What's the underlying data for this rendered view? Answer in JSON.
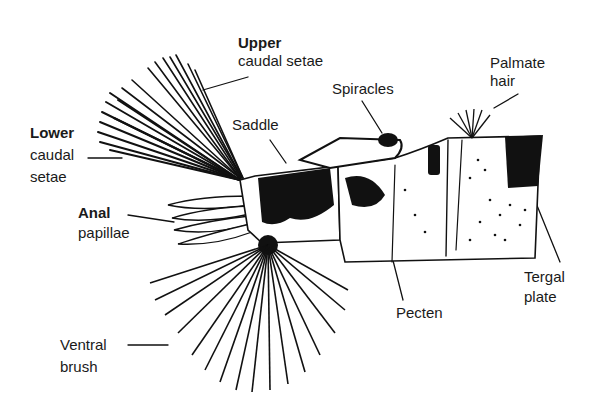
{
  "diagram": {
    "labels": {
      "upper_caudal_setae": {
        "line1": "Upper",
        "line2": "caudal setae"
      },
      "lower_caudal_setae": {
        "line1": "Lower",
        "line2": "caudal",
        "line3": "setae"
      },
      "saddle": "Saddle",
      "spiracles": "Spiracles",
      "palmate_hair": {
        "line1": "Palmate",
        "line2": "hair"
      },
      "anal_papillae": {
        "line1": "Anal",
        "line2": "papillae"
      },
      "ventral_brush": {
        "line1": "Ventral",
        "line2": "brush"
      },
      "pecten": "Pecten",
      "tergal_plate": {
        "line1": "Tergal",
        "line2": "plate"
      }
    }
  }
}
